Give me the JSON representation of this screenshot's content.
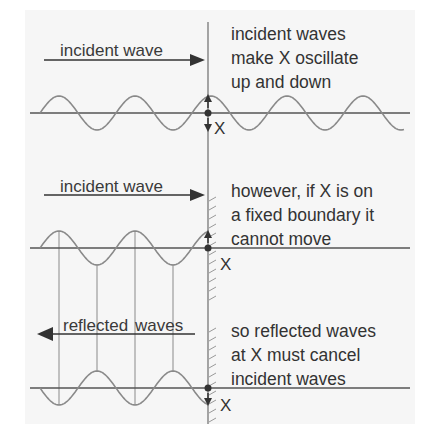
{
  "diagram": {
    "colors": {
      "background": "#f6f6f6",
      "wave": "#8a8a8a",
      "axis": "#555555",
      "arrow": "#333333",
      "text": "#333333"
    },
    "panels": [
      {
        "id": "free-oscillation",
        "arrow_label": "incident wave",
        "arrow_direction": "right",
        "caption_lines": [
          "incident waves",
          "make X oscillate",
          "up and down"
        ],
        "point_label": "X",
        "boundary": "free",
        "wave_phase": "incident",
        "motion_arrows": [
          "up",
          "down"
        ]
      },
      {
        "id": "fixed-boundary",
        "arrow_label": "incident wave",
        "arrow_direction": "right",
        "caption_lines": [
          "however, if X is on",
          "a fixed boundary it",
          "cannot move"
        ],
        "point_label": "X",
        "boundary": "fixed",
        "wave_phase": "incident",
        "motion_arrows": [
          "up"
        ]
      },
      {
        "id": "reflection",
        "arrow_label_parts": [
          "reflected",
          "waves"
        ],
        "arrow_label": "reflected waves",
        "arrow_direction": "left",
        "caption_lines": [
          "so reflected waves",
          "at X must cancel",
          "incident waves"
        ],
        "point_label": "X",
        "boundary": "fixed",
        "wave_phase": "inverted",
        "motion_arrows": [
          "down"
        ]
      }
    ]
  }
}
